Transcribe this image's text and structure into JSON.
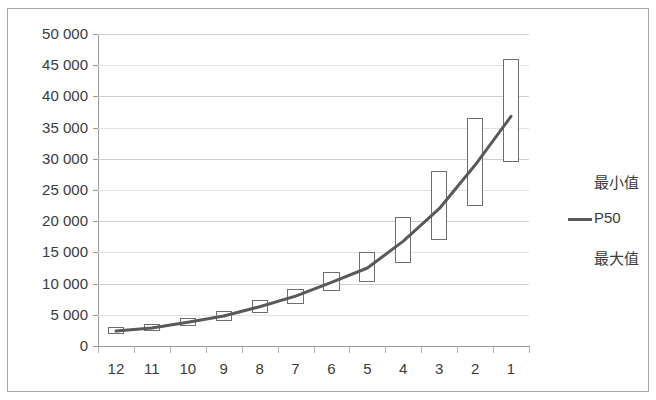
{
  "chart_data": {
    "type": "bar",
    "subtype": "high-low-range-with-median-line",
    "title": "",
    "xlabel": "",
    "ylabel": "",
    "categories": [
      "12",
      "11",
      "10",
      "9",
      "8",
      "7",
      "6",
      "5",
      "4",
      "3",
      "2",
      "1"
    ],
    "ylim": [
      0,
      50000
    ],
    "ytick_step": 5000,
    "ytick_labels": [
      "50 000",
      "45 000",
      "40 000",
      "35 000",
      "30 000",
      "25 000",
      "20 000",
      "15 000",
      "10 000",
      "5 000",
      "0"
    ],
    "ytick_values": [
      50000,
      45000,
      40000,
      35000,
      30000,
      25000,
      20000,
      15000,
      10000,
      5000,
      0
    ],
    "grid": true,
    "legend_position": "right",
    "series": [
      {
        "name": "最小值",
        "role": "min",
        "values": [
          2000,
          2400,
          3200,
          4000,
          5300,
          6800,
          8800,
          10200,
          13300,
          17000,
          22500,
          29500
        ]
      },
      {
        "name": "P50",
        "role": "median",
        "values": [
          2400,
          2900,
          3800,
          4800,
          6300,
          8000,
          10200,
          12500,
          16800,
          22000,
          29000,
          36800
        ]
      },
      {
        "name": "最大值",
        "role": "max",
        "values": [
          3000,
          3600,
          4500,
          5600,
          7300,
          9200,
          11800,
          15000,
          20700,
          28000,
          36500,
          46000
        ]
      }
    ],
    "colors": {
      "box_border": "#6e6e6e",
      "box_fill": "#ffffff",
      "median_line": "#595959",
      "gridline": "#d0d0d0",
      "axis": "#9a9a9a",
      "text": "#3b3b3b",
      "frame": "#a6a6a6"
    }
  },
  "legend": {
    "items": [
      {
        "label": "最小值",
        "marker": "none"
      },
      {
        "label": "P50",
        "marker": "line"
      },
      {
        "label": "最大值",
        "marker": "none"
      }
    ]
  }
}
